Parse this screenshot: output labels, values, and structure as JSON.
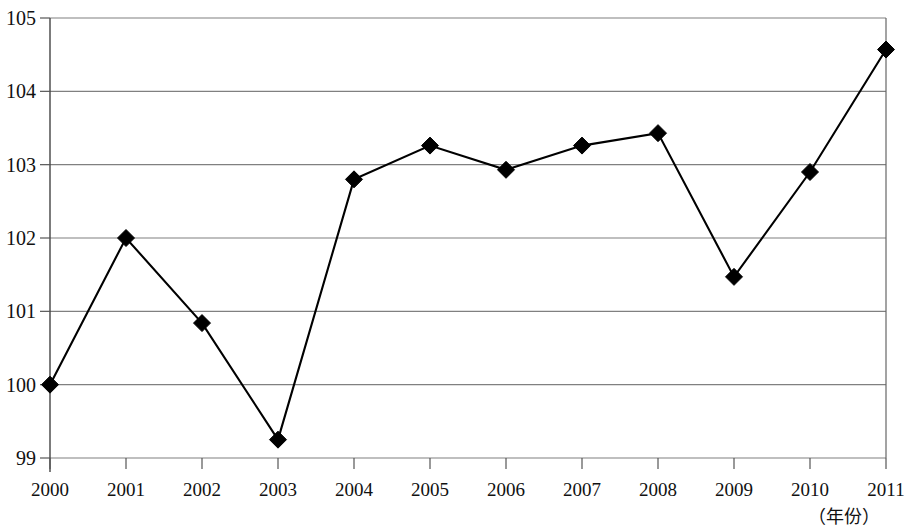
{
  "chart_data": {
    "type": "line",
    "title": "",
    "subtitle": "",
    "xlabel": "（年份）",
    "ylabel": "",
    "categories": [
      "2000",
      "2001",
      "2002",
      "2003",
      "2004",
      "2005",
      "2006",
      "2007",
      "2008",
      "2009",
      "2010",
      "2011"
    ],
    "values": [
      100.0,
      102.0,
      100.84,
      99.25,
      102.8,
      103.26,
      102.93,
      103.26,
      103.43,
      101.47,
      102.9,
      104.57
    ],
    "series": [
      {
        "name": "",
        "values": [
          100.0,
          102.0,
          100.84,
          99.25,
          102.8,
          103.26,
          102.93,
          103.26,
          103.43,
          101.47,
          102.9,
          104.57
        ]
      }
    ],
    "ylim": [
      99,
      105
    ],
    "yticks": [
      99,
      100,
      101,
      102,
      103,
      104,
      105
    ],
    "ytick_labels": [
      "99",
      "100",
      "101",
      "102",
      "103",
      "104",
      "105"
    ],
    "xtick_labels": [
      "2000",
      "2001",
      "2002",
      "2003",
      "2004",
      "2005",
      "2006",
      "2007",
      "2008",
      "2009",
      "2010",
      "2011"
    ],
    "grid": "horizontal",
    "legend": "none",
    "marker": "diamond",
    "line_color": "#000000",
    "marker_color": "#000000",
    "grid_color": "#808080",
    "axis_color": "#555555",
    "background_color": "#ffffff"
  }
}
